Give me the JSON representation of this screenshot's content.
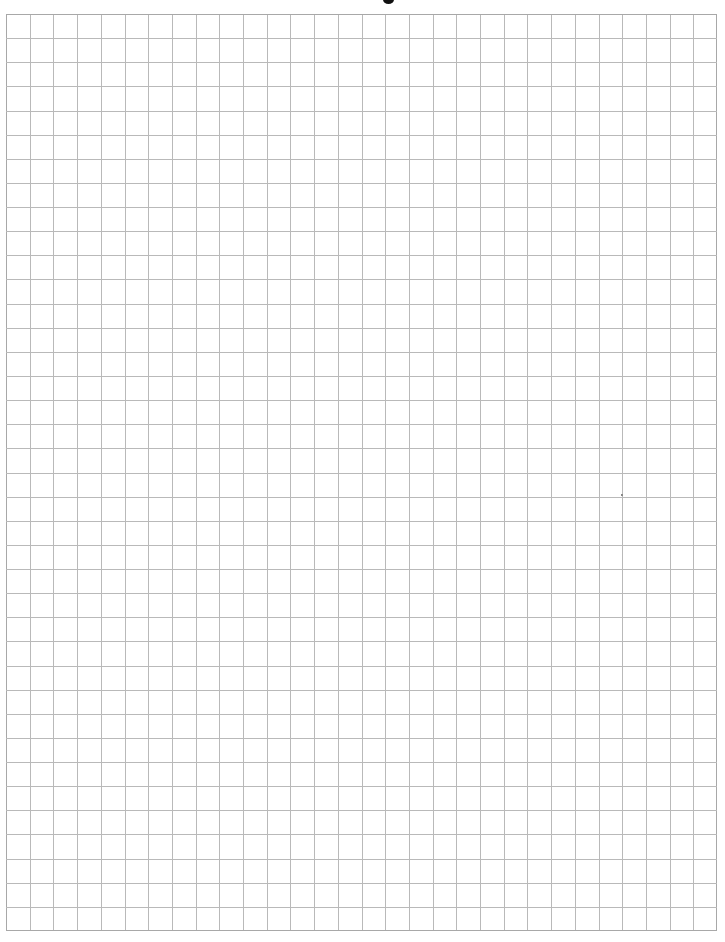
{
  "page": {
    "title_visible_fragment": "",
    "background_color": "#ffffff"
  },
  "grid": {
    "columns": 30,
    "rows": 38,
    "left": 6,
    "top": 14,
    "width": 711,
    "height": 917,
    "line_color": "#b9b9b9",
    "border_color": "#a8a8a8"
  },
  "artifacts": [
    {
      "x": 621,
      "y": 494
    }
  ]
}
